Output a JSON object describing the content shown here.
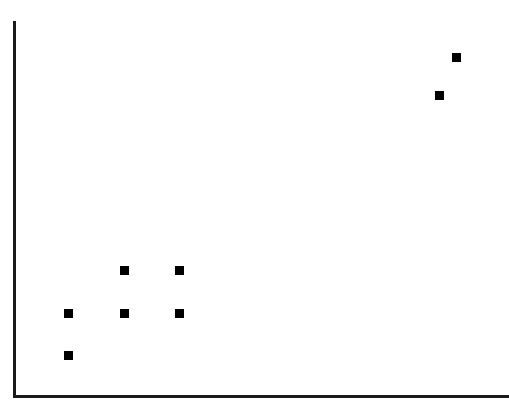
{
  "chart_data": {
    "type": "scatter",
    "title": "",
    "subtitle": "",
    "xlabel": "",
    "ylabel": "",
    "legend": [],
    "legend_position": "none",
    "grid": false,
    "x_tick_labels": [],
    "y_tick_labels": [],
    "xlim": [
      0,
      100
    ],
    "ylim": [
      0,
      100
    ],
    "marker_shape": "square",
    "marker_color": "#000000",
    "marker_size_px": 9,
    "series": [
      {
        "name": "series-1",
        "points": [
          {
            "x": 11.0,
            "y": 22.3
          },
          {
            "x": 11.0,
            "y": 11.1
          },
          {
            "x": 22.3,
            "y": 33.7
          },
          {
            "x": 22.3,
            "y": 22.3
          },
          {
            "x": 33.4,
            "y": 33.7
          },
          {
            "x": 33.4,
            "y": 22.3
          },
          {
            "x": 85.9,
            "y": 80.4
          },
          {
            "x": 89.4,
            "y": 90.5
          }
        ]
      }
    ],
    "pixel_points": [
      {
        "id": "pt-1",
        "cx": 68.0,
        "cy": 313.5
      },
      {
        "id": "pt-2",
        "cx": 68.0,
        "cy": 355.5
      },
      {
        "id": "pt-3",
        "cx": 124.0,
        "cy": 270.5
      },
      {
        "id": "pt-4",
        "cx": 124.0,
        "cy": 313.5
      },
      {
        "id": "pt-5",
        "cx": 179.0,
        "cy": 270.5
      },
      {
        "id": "pt-6",
        "cx": 179.0,
        "cy": 313.5
      },
      {
        "id": "pt-7",
        "cx": 439.5,
        "cy": 95.5
      },
      {
        "id": "pt-8",
        "cx": 456.5,
        "cy": 57.5
      }
    ],
    "axes": {
      "color": "#1a1a1a",
      "line_width_px": 3,
      "y_axis": {
        "x": 13,
        "y_top": 21,
        "y_bottom": 398
      },
      "x_axis": {
        "y": 395,
        "x_left": 13,
        "x_right": 509
      },
      "ticks_visible": false,
      "tick_labels_visible": false
    },
    "background_color": "#ffffff"
  }
}
